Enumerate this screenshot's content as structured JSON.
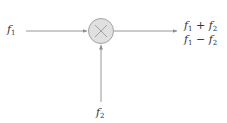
{
  "diagram": {
    "type": "mixer-block",
    "inputs": [
      {
        "id": "f1",
        "base": "f",
        "sub": "1"
      },
      {
        "id": "f2",
        "base": "f",
        "sub": "2"
      }
    ],
    "node": {
      "symbol": "×",
      "label": "multiplier",
      "fill": "#e0e0e0",
      "stroke": "#9a9a9a"
    },
    "outputs": [
      {
        "expr": "f1 + f2",
        "a_base": "f",
        "a_sub": "1",
        "op": "+",
        "b_base": "f",
        "b_sub": "2"
      },
      {
        "expr": "f1 − f2",
        "a_base": "f",
        "a_sub": "1",
        "op": "−",
        "b_base": "f",
        "b_sub": "2"
      }
    ],
    "line_color": "#8a8a8a"
  }
}
